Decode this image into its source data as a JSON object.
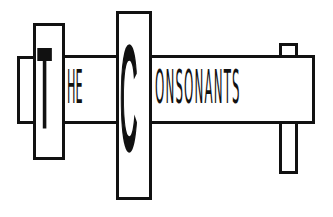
{
  "logo": {
    "word_the_initial": "T",
    "word_the_rest": "HE",
    "word_consonants_initial": "C",
    "word_consonants_rest": "ONSONANTS",
    "full_text": "THE CONSONANTS"
  },
  "colors": {
    "ink": "#111111",
    "background": "#ffffff"
  }
}
